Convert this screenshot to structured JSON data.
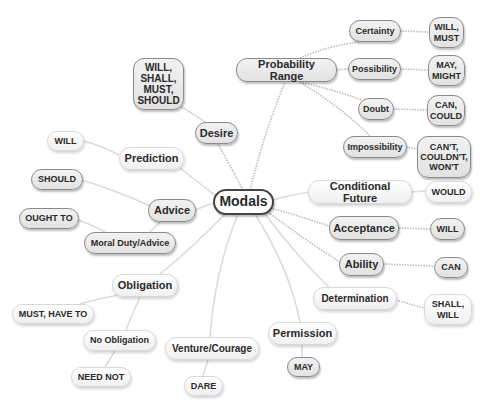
{
  "title": "Modals",
  "nodes": {
    "modals": "Modals",
    "desire": "Desire",
    "desire_words": "WILL,\nSHALL,\nMUST,\nSHOULD",
    "probability_range": "Probability Range",
    "certainty": "Certainty",
    "certainty_words": "WILL,\nMUST",
    "possibility": "Possibility",
    "possibility_words": "MAY,\nMIGHT",
    "doubt": "Doubt",
    "doubt_words": "CAN,\nCOULD",
    "impossibility": "Impossibility",
    "impossibility_words": "CAN'T,\nCOULDN'T,\nWON'T",
    "conditional_future": "Conditional Future",
    "conditional_future_words": "WOULD",
    "acceptance": "Acceptance",
    "acceptance_words": "WILL",
    "ability": "Ability",
    "ability_words": "CAN",
    "determination": "Determination",
    "determination_words": "SHALL,\nWILL",
    "permission": "Permission",
    "permission_words": "MAY",
    "venture": "Venture/Courage",
    "venture_words": "DARE",
    "obligation": "Obligation",
    "obligation_words": "MUST, HAVE TO",
    "no_obligation": "No Obligation",
    "no_obligation_words": "NEED NOT",
    "advice": "Advice",
    "advice_words": "SHOULD",
    "moral_duty": "Moral Duty/Advice",
    "moral_duty_words": "OUGHT TO",
    "prediction": "Prediction",
    "prediction_words": "WILL"
  },
  "colors": {
    "gray_node_fill": "#e8e8e8",
    "gray_node_border": "#8a8a8a",
    "light_node_fill": "#ffffff",
    "center_border": "#444444",
    "text": "#2a2a2a",
    "link": "#c4c4c4"
  }
}
